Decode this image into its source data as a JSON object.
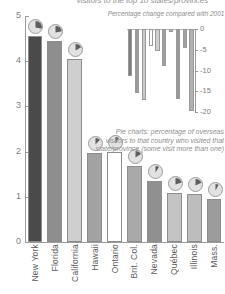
{
  "figure": {
    "top_title": "visitors to the top 10 states/provinces",
    "caption": "Pie charts: percentage of overseas visitors to that country who visited that state/province (some visit more than one)"
  },
  "chart_data": [
    {
      "type": "bar",
      "title": "",
      "xlabel": "",
      "ylabel": "",
      "ylim": [
        0,
        5
      ],
      "yticks": [
        0,
        1,
        2,
        3,
        4,
        5
      ],
      "ytick_labels": [
        "0",
        "1",
        "2",
        "3",
        "4",
        "5"
      ],
      "grid": false,
      "legend": "none",
      "categories": [
        "New York",
        "Florida",
        "California",
        "Hawaii",
        "Ontario",
        "Brit. Col.",
        "Nevada",
        "Québec",
        "Illinois",
        "Mass."
      ],
      "values": [
        4.55,
        4.45,
        4.05,
        1.98,
        2.0,
        1.68,
        1.35,
        1.08,
        1.07,
        0.95
      ],
      "colors": [
        "#4a4a4a",
        "#8e8e8e",
        "#cfcfcf",
        "#a2a2a2",
        "#ffffff",
        "#a9a9a9",
        "#909090",
        "#c3c3c3",
        "#bdbdbd",
        "#9c9c9c"
      ],
      "pie_values": [
        28,
        22,
        17,
        12,
        9,
        16,
        9,
        20,
        18,
        8
      ]
    },
    {
      "type": "bar",
      "title": "Percentage change compared with 2001",
      "xlabel": "",
      "ylabel": "",
      "ylim": [
        -20,
        0
      ],
      "yticks": [
        0,
        -5,
        -10,
        -15,
        -20
      ],
      "ytick_labels": [
        "0",
        "-5",
        "-10",
        "-15",
        "-20"
      ],
      "grid": false,
      "legend": "none",
      "categories": [
        "New York",
        "Florida",
        "California",
        "Hawaii",
        "Ontario",
        "Brit. Col.",
        "Nevada",
        "Québec",
        "Illinois",
        "Mass."
      ],
      "values": [
        -11.3,
        -15.4,
        -17.0,
        -4.0,
        -5.3,
        -9.0,
        -0.8,
        -16.8,
        -4.6,
        -19.8
      ],
      "colors": [
        "#7d7d7d",
        "#9a9a9a",
        "#c9c9c9",
        "#ffffff",
        "#cfcfcf",
        "#a0a0a0",
        "#b6b6b6",
        "#9a9a9a",
        "#a0a0a0",
        "#b0b0b0"
      ]
    }
  ]
}
